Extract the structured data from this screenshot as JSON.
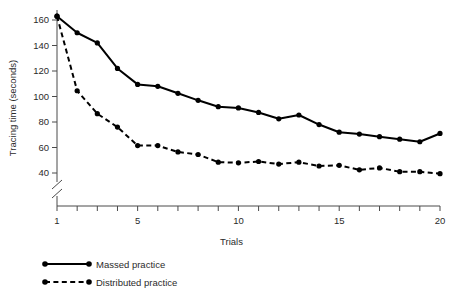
{
  "chart_data": {
    "type": "line",
    "title": "",
    "xlabel": "Trials",
    "ylabel": "Tracing time (seconds)",
    "x": [
      1,
      2,
      3,
      4,
      5,
      6,
      7,
      8,
      9,
      10,
      11,
      12,
      13,
      14,
      15,
      16,
      17,
      18,
      19,
      20
    ],
    "xlim": [
      1,
      20
    ],
    "ylim": [
      30,
      168
    ],
    "xticks": [
      1,
      2,
      3,
      4,
      5,
      6,
      7,
      8,
      9,
      10,
      11,
      12,
      13,
      14,
      15,
      16,
      17,
      18,
      19,
      20
    ],
    "xtick_labels": [
      "1",
      "",
      "",
      "",
      "5",
      "",
      "",
      "",
      "",
      "10",
      "",
      "",
      "",
      "",
      "15",
      "",
      "",
      "",
      "",
      "20"
    ],
    "yticks": [
      40,
      60,
      80,
      100,
      120,
      140,
      160
    ],
    "ytick_labels": [
      "40",
      "60",
      "80",
      "100",
      "120",
      "140",
      "160"
    ],
    "grid": false,
    "y_axis_break": true,
    "legend_position": "below-left",
    "series": [
      {
        "name": "Massed practice",
        "style": "solid",
        "marker": "circle",
        "values": [
          163,
          150,
          142,
          122,
          109.5,
          108,
          102.5,
          97,
          92,
          91,
          87.5,
          82.5,
          85.5,
          78,
          72,
          70.5,
          68.5,
          66.5,
          64.5,
          71
        ]
      },
      {
        "name": "Distributed practice",
        "style": "dashed",
        "marker": "circle",
        "values": [
          163,
          104.5,
          86.5,
          76,
          61.5,
          61.5,
          56.5,
          54.5,
          48.5,
          48,
          49,
          47,
          48.5,
          45.5,
          46,
          42.5,
          44,
          41,
          41,
          39.5
        ]
      }
    ]
  },
  "legend": {
    "items": [
      {
        "label": "Massed practice",
        "style": "solid"
      },
      {
        "label": "Distributed practice",
        "style": "dashed"
      }
    ]
  }
}
